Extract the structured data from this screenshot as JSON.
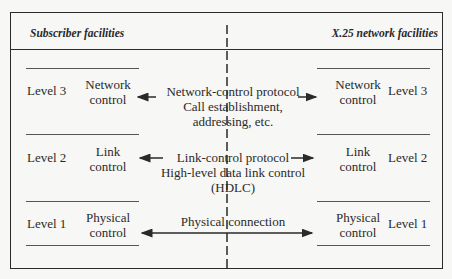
{
  "headers": {
    "left": "Subscriber facilities",
    "right": "X.25 network facilities"
  },
  "levels": [
    {
      "left_level": "Level 3",
      "left_control": [
        "Network",
        "control"
      ],
      "protocol": [
        "Network-control protocol",
        "Call establishment,",
        "addressing, etc."
      ],
      "right_control": [
        "Network",
        "control"
      ],
      "right_level": "Level 3"
    },
    {
      "left_level": "Level 2",
      "left_control": [
        "Link",
        "control"
      ],
      "protocol": [
        "Link-control protocol",
        "High-level data link control",
        "(HDLC)"
      ],
      "right_control": [
        "Link",
        "control"
      ],
      "right_level": "Level 2"
    },
    {
      "left_level": "Level 1",
      "left_control": [
        "Physical",
        "control"
      ],
      "protocol": [
        "Physical connection"
      ],
      "right_control": [
        "Physical",
        "control"
      ],
      "right_level": "Level 1"
    }
  ]
}
